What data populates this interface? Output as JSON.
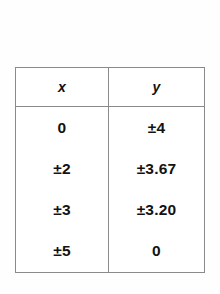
{
  "table": {
    "headers": [
      {
        "label": "x",
        "style": "italic"
      },
      {
        "label": "y",
        "style": "italic"
      }
    ],
    "rows": [
      {
        "x": "0",
        "y": "±4"
      },
      {
        "x": "±2",
        "y": "±3.67"
      },
      {
        "x": "±3",
        "y": "±3.20"
      },
      {
        "x": "±5",
        "y": "0"
      }
    ]
  },
  "colors": {
    "page_background": "#fefefe",
    "table_background": "#ffffff",
    "border": "#8a8a8a",
    "text": "#121212"
  }
}
